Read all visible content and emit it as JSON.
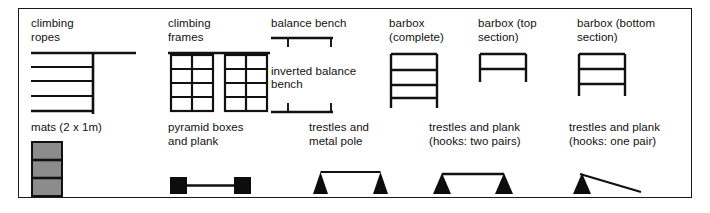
{
  "panel": {
    "title": "apparatus legend",
    "border_color": "#1a1a1a",
    "background_color": "#ffffff",
    "ink_color": "#111111",
    "mat_fill_color": "#8c8c8c"
  },
  "rows": [
    {
      "name": "top-row",
      "items": [
        {
          "id": "climbing-ropes",
          "label": "climbing\nropes",
          "icon": "climbing-ropes-icon"
        },
        {
          "id": "climbing-frames",
          "label": "climbing\nframes",
          "icon": "climbing-frames-icon"
        },
        {
          "id": "balance-bench",
          "label": "balance bench",
          "icon": "balance-bench-icon"
        },
        {
          "id": "inverted-balance-bench",
          "label": "inverted balance\nbench",
          "icon": "inverted-balance-bench-icon"
        },
        {
          "id": "barbox-complete",
          "label": "barbox\n(complete)",
          "icon": "barbox-complete-icon"
        },
        {
          "id": "barbox-top-section",
          "label": "barbox (top\nsection)",
          "icon": "barbox-top-section-icon"
        },
        {
          "id": "barbox-bottom-section",
          "label": "barbox (bottom\nsection)",
          "icon": "barbox-bottom-section-icon"
        }
      ]
    },
    {
      "name": "bottom-row",
      "items": [
        {
          "id": "mats",
          "label": "mats (2 x 1m)",
          "icon": "mats-icon"
        },
        {
          "id": "pyramid-boxes-and-plank",
          "label": "pyramid boxes\nand plank",
          "icon": "pyramid-boxes-and-plank-icon"
        },
        {
          "id": "trestles-and-metal-pole",
          "label": "trestles and\nmetal pole",
          "icon": "trestles-and-metal-pole-icon"
        },
        {
          "id": "trestles-and-plank-two-pairs",
          "label": "trestles and plank\n(hooks: two pairs)",
          "icon": "trestles-and-plank-two-pairs-icon"
        },
        {
          "id": "trestles-and-plank-one-pair",
          "label": "trestles and plank\n(hooks: one pair)",
          "icon": "trestles-and-plank-one-pair-icon"
        }
      ]
    }
  ]
}
